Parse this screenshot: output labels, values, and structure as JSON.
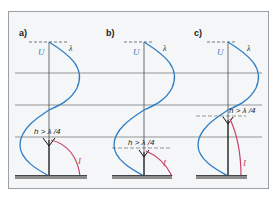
{
  "figure": {
    "colors": {
      "background": "#f4f6f8",
      "frame": "#9aa0a6",
      "grid": "#555555",
      "voltage_curve": "#2f7ec2",
      "current_curve": "#c8416b",
      "ground": "#8c8c8c"
    },
    "panels": [
      {
        "label": "a)",
        "voltage_label": "U",
        "wavelength_label": "λ",
        "height_label": "h > λ /4",
        "current_label": "I"
      },
      {
        "label": "b)",
        "voltage_label": "U",
        "wavelength_label": "λ",
        "height_label": "h > λ /4",
        "current_label": "I"
      },
      {
        "label": "c)",
        "voltage_label": "U",
        "wavelength_label": "λ",
        "height_label": "h > λ /4",
        "current_label": "I"
      }
    ]
  }
}
